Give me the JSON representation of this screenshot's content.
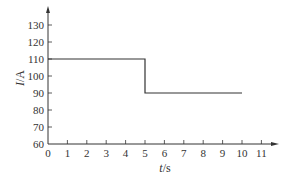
{
  "chart_data": {
    "type": "line",
    "title": "",
    "xlabel": "t/s",
    "ylabel": "I/A",
    "xlim": [
      0,
      11
    ],
    "ylim": [
      60,
      130
    ],
    "grid": false,
    "legend": null,
    "x_ticks": [
      "0",
      "1",
      "2",
      "3",
      "4",
      "5",
      "6",
      "7",
      "8",
      "9",
      "10",
      "11"
    ],
    "y_ticks": [
      "60",
      "70",
      "80",
      "90",
      "100",
      "110",
      "120",
      "130"
    ],
    "series": [
      {
        "name": "I(t)",
        "step": true,
        "x": [
          0,
          5,
          5,
          10
        ],
        "y": [
          110,
          110,
          90,
          90
        ]
      }
    ],
    "colors": {
      "axis": "#333333",
      "line": "#333333"
    }
  },
  "labels": {
    "x_axis_var": "t",
    "x_axis_unit": "/s",
    "y_axis_var": "I",
    "y_axis_unit": "/A"
  }
}
